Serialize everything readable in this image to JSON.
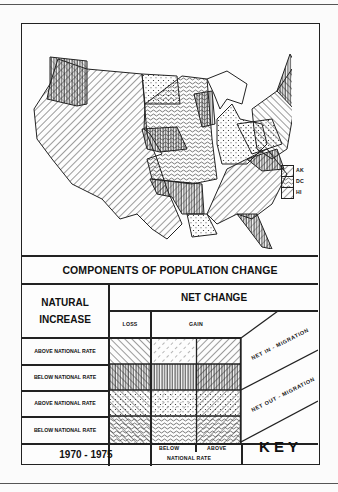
{
  "figure": {
    "title": "COMPONENTS OF POPULATION CHANGE",
    "period": "1970 - 1975",
    "key_label": "KEY"
  },
  "map": {
    "subject": "United States map shaded by components of population change",
    "inset_legend": [
      {
        "label": "AK",
        "pattern": "diag-fwd-wide"
      },
      {
        "label": "DC",
        "pattern": "dotted-diag-dense"
      },
      {
        "label": "HI",
        "pattern": "diag-fwd-wide"
      }
    ]
  },
  "key": {
    "natural_increase_header_line1": "NATURAL",
    "natural_increase_header_line2": "INCREASE",
    "net_change_header": "NET CHANGE",
    "loss_label": "LOSS",
    "gain_label": "GAIN",
    "gain_below_label": "BELOW",
    "gain_above_label": "ABOVE",
    "national_rate_label": "NATIONAL RATE",
    "migration_labels": [
      "NET IN - MIGRATION",
      "NET OUT - MIGRATION"
    ],
    "rows": [
      {
        "label": "ABOVE NATIONAL RATE",
        "migration": "NET IN - MIGRATION",
        "patterns": [
          "diag-back",
          "diag-fwd-dashed",
          "diag-fwd"
        ]
      },
      {
        "label": "BELOW NATIONAL RATE",
        "migration": "NET IN - MIGRATION",
        "patterns": [
          "diag-back-vertical",
          "vertical",
          "diag-fwd-vertical"
        ]
      },
      {
        "label": "ABOVE NATIONAL RATE",
        "migration": "NET OUT - MIGRATION",
        "patterns": [
          "diag-back-dots",
          "dots",
          "diag-fwd-dots"
        ]
      },
      {
        "label": "BELOW NATIONAL RATE",
        "migration": "NET OUT - MIGRATION",
        "patterns": [
          "diag-back-squiggle",
          "squiggle",
          "diag-fwd-squiggle"
        ]
      }
    ]
  }
}
